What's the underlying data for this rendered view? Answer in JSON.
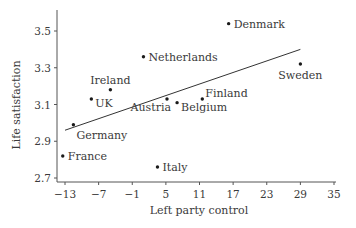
{
  "chart_data": {
    "type": "scatter",
    "title": "",
    "xlabel": "Left party control",
    "ylabel": "Life satisfaction",
    "xlim": [
      -14.5,
      35.5
    ],
    "ylim": [
      2.68,
      3.62
    ],
    "x_ticks": [
      -13,
      -7,
      -1,
      5,
      11,
      17,
      23,
      29,
      35
    ],
    "x_tick_labels": [
      "−13",
      "−7",
      "−1",
      "5",
      "11",
      "17",
      "23",
      "29",
      "35"
    ],
    "y_ticks": [
      2.7,
      2.9,
      3.1,
      3.3,
      3.5
    ],
    "y_tick_labels": [
      "2.7",
      "2.9",
      "3.1",
      "3.3",
      "3.5"
    ],
    "grid": false,
    "legend": null,
    "points": [
      {
        "label": "Denmark",
        "x": 16.2,
        "y": 3.54,
        "label_pos": "right"
      },
      {
        "label": "Netherlands",
        "x": 1.0,
        "y": 3.36,
        "label_pos": "right"
      },
      {
        "label": "Sweden",
        "x": 29.0,
        "y": 3.32,
        "label_pos": "below"
      },
      {
        "label": "Ireland",
        "x": -4.9,
        "y": 3.18,
        "label_pos": "above"
      },
      {
        "label": "UK",
        "x": -8.3,
        "y": 3.13,
        "label_pos": "right-below"
      },
      {
        "label": "Finland",
        "x": 11.5,
        "y": 3.13,
        "label_pos": "right-above"
      },
      {
        "label": "Austria",
        "x": 5.2,
        "y": 3.13,
        "label_pos": "below-left"
      },
      {
        "label": "Belgium",
        "x": 7.0,
        "y": 3.11,
        "label_pos": "right-below"
      },
      {
        "label": "Germany",
        "x": -11.5,
        "y": 2.99,
        "label_pos": "below-right"
      },
      {
        "label": "France",
        "x": -13.4,
        "y": 2.82,
        "label_pos": "right"
      },
      {
        "label": "Italy",
        "x": 3.5,
        "y": 2.76,
        "label_pos": "right"
      }
    ],
    "trend_line": {
      "x1": -13.0,
      "y1": 2.96,
      "x2": 29.0,
      "y2": 3.4
    },
    "colors": {
      "points": "#1a1a1a",
      "axis": "#555555",
      "text": "#3a3a3a",
      "line": "#333333"
    }
  }
}
